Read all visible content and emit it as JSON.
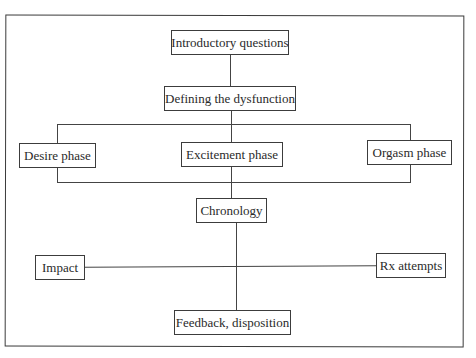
{
  "diagram": {
    "type": "flowchart",
    "nodes": {
      "intro": "Introductory questions",
      "defining": "Defining the dysfunction",
      "desire": "Desire phase",
      "excitement": "Excitement phase",
      "orgasm": "Orgasm phase",
      "chronology": "Chronology",
      "impact": "Impact",
      "rx": "Rx attempts",
      "feedback": "Feedback, disposition"
    },
    "edges": [
      [
        "intro",
        "defining"
      ],
      [
        "defining",
        "excitement"
      ],
      [
        "defining",
        "desire"
      ],
      [
        "defining",
        "orgasm"
      ],
      [
        "excitement",
        "chronology"
      ],
      [
        "chronology",
        "feedback"
      ],
      [
        "impact",
        "rx"
      ]
    ],
    "colors": {
      "line": "#444444",
      "text": "#2a2a2a",
      "background": "#ffffff"
    }
  }
}
